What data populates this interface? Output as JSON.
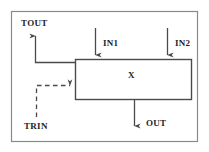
{
  "diagram": {
    "colors": {
      "stroke": "#4a4a4a",
      "label": "#242424",
      "background": "#ffffff",
      "frame": "#7a7a7a"
    },
    "frame": {
      "name": "outer-border",
      "x": 11,
      "y": 11,
      "width": 187,
      "height": 131
    },
    "block": {
      "label": "X",
      "x": 75,
      "y": 59,
      "width": 117,
      "height": 41
    },
    "signals": [
      {
        "name": "tout",
        "label": "TOUT",
        "direction": "out",
        "style": "solid",
        "edge": "left"
      },
      {
        "name": "trin",
        "label": "TRIN",
        "direction": "in",
        "style": "dashed",
        "edge": "left"
      },
      {
        "name": "in1",
        "label": "IN1",
        "direction": "in",
        "style": "solid",
        "edge": "top"
      },
      {
        "name": "in2",
        "label": "IN2",
        "direction": "in",
        "style": "solid",
        "edge": "top"
      },
      {
        "name": "out",
        "label": "OUT",
        "direction": "out",
        "style": "solid",
        "edge": "bottom"
      }
    ]
  }
}
